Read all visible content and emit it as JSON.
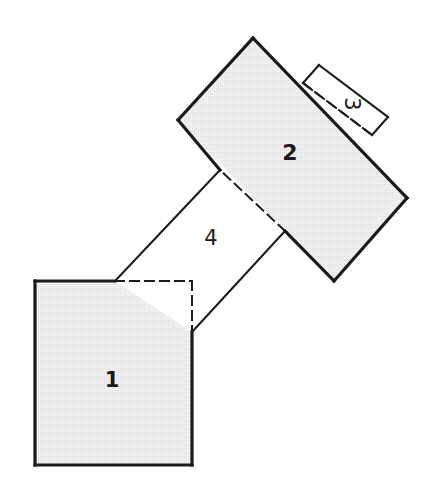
{
  "figure": {
    "background_color": "#ffffff",
    "stroke_color": "#1a1a1a",
    "fill_shaded": "#ededed",
    "fill_open": "#ffffff",
    "canvas": {
      "width": 436,
      "height": 500
    }
  },
  "shapes": [
    {
      "id": "region-1",
      "label": "1",
      "kind": "square",
      "shading": "shaded",
      "label_position": {
        "x": 112,
        "y": 387
      },
      "label_rotation": 0,
      "outline": [
        {
          "x": 35,
          "y": 281
        },
        {
          "x": 192,
          "y": 281
        },
        {
          "x": 192,
          "y": 465
        },
        {
          "x": 35,
          "y": 465
        }
      ],
      "solid_edges": [
        {
          "x1": 35,
          "y1": 281,
          "x2": 115,
          "y2": 281
        },
        {
          "x1": 35,
          "y1": 281,
          "x2": 35,
          "y2": 465
        },
        {
          "x1": 35,
          "y1": 465,
          "x2": 192,
          "y2": 465
        },
        {
          "x1": 192,
          "y1": 332,
          "x2": 192,
          "y2": 465
        }
      ],
      "dashed_edges": [
        {
          "x1": 115,
          "y1": 281,
          "x2": 192,
          "y2": 281
        },
        {
          "x1": 192,
          "y1": 281,
          "x2": 192,
          "y2": 332
        }
      ]
    },
    {
      "id": "region-2",
      "label": "2",
      "kind": "rotated-rectangle",
      "shading": "shaded",
      "label_position": {
        "x": 290,
        "y": 160
      },
      "label_rotation": 0,
      "outline": [
        {
          "x": 253,
          "y": 38
        },
        {
          "x": 407,
          "y": 198
        },
        {
          "x": 334,
          "y": 281
        },
        {
          "x": 178,
          "y": 120
        }
      ],
      "solid_edges": [
        {
          "x1": 253,
          "y1": 38,
          "x2": 407,
          "y2": 198
        },
        {
          "x1": 407,
          "y1": 198,
          "x2": 334,
          "y2": 281
        },
        {
          "x1": 334,
          "y1": 281,
          "x2": 285,
          "y2": 231
        },
        {
          "x1": 220,
          "y1": 170,
          "x2": 178,
          "y2": 120
        },
        {
          "x1": 178,
          "y1": 120,
          "x2": 253,
          "y2": 38
        }
      ],
      "dashed_edges": [
        {
          "x1": 285,
          "y1": 231,
          "x2": 220,
          "y2": 170
        },
        {
          "x1": 303,
          "y1": 83,
          "x2": 372,
          "y2": 135
        }
      ]
    },
    {
      "id": "region-3",
      "label": "3",
      "kind": "rotated-rectangle",
      "shading": "open",
      "label_position": {
        "x": 345,
        "y": 104
      },
      "label_rotation": 90,
      "outline": [
        {
          "x": 303,
          "y": 83
        },
        {
          "x": 319,
          "y": 65
        },
        {
          "x": 388,
          "y": 117
        },
        {
          "x": 372,
          "y": 135
        }
      ],
      "solid_edges": [
        {
          "x1": 303,
          "y1": 83,
          "x2": 319,
          "y2": 65
        },
        {
          "x1": 319,
          "y1": 65,
          "x2": 388,
          "y2": 117
        },
        {
          "x1": 388,
          "y1": 117,
          "x2": 372,
          "y2": 135
        }
      ],
      "dashed_edges": [
        {
          "x1": 372,
          "y1": 135,
          "x2": 303,
          "y2": 83
        }
      ]
    },
    {
      "id": "region-4",
      "label": "4",
      "kind": "connector-parallelogram",
      "shading": "open",
      "label_position": {
        "x": 211,
        "y": 245
      },
      "label_rotation": 0,
      "outline": [
        {
          "x": 115,
          "y": 281
        },
        {
          "x": 220,
          "y": 170
        },
        {
          "x": 285,
          "y": 231
        },
        {
          "x": 192,
          "y": 332
        }
      ],
      "solid_edges": [
        {
          "x1": 115,
          "y1": 281,
          "x2": 220,
          "y2": 170
        },
        {
          "x1": 285,
          "y1": 231,
          "x2": 192,
          "y2": 332
        }
      ],
      "dashed_edges": []
    }
  ],
  "stroke_widths": {
    "outer": 3.2,
    "inner": 2.0,
    "dash": 2.0
  },
  "dash_pattern": "9 6"
}
